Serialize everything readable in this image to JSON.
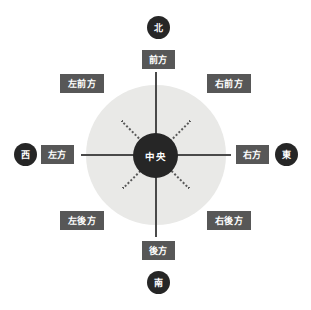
{
  "diagram": {
    "center": {
      "label": "中央",
      "meaning": "center"
    },
    "plate_color": "#e9e9e7",
    "tag_color": "#575757",
    "badge_color": "#262626",
    "line_color": "#4a4a4a",
    "directions": [
      {
        "key": "front",
        "label": "前方",
        "angle_deg": 90,
        "line_style": "solid"
      },
      {
        "key": "right-front",
        "label": "右前方",
        "angle_deg": 45,
        "line_style": "dotted"
      },
      {
        "key": "right",
        "label": "右方",
        "angle_deg": 0,
        "line_style": "solid"
      },
      {
        "key": "right-rear",
        "label": "右後方",
        "angle_deg": 315,
        "line_style": "dotted"
      },
      {
        "key": "rear",
        "label": "後方",
        "angle_deg": 270,
        "line_style": "solid"
      },
      {
        "key": "left-rear",
        "label": "左後方",
        "angle_deg": 225,
        "line_style": "dotted"
      },
      {
        "key": "left",
        "label": "左方",
        "angle_deg": 180,
        "line_style": "solid"
      },
      {
        "key": "left-front",
        "label": "左前方",
        "angle_deg": 135,
        "line_style": "dotted"
      }
    ],
    "cardinals": [
      {
        "key": "north",
        "label": "北",
        "position": "top"
      },
      {
        "key": "east",
        "label": "東",
        "position": "right"
      },
      {
        "key": "south",
        "label": "南",
        "position": "bottom"
      },
      {
        "key": "west",
        "label": "西",
        "position": "left"
      }
    ]
  }
}
